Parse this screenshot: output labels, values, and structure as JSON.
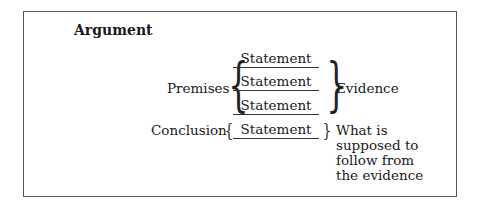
{
  "title": "Argument",
  "premises": {
    "label": "Premises",
    "statements": [
      "Statement",
      "Statement",
      "Statement"
    ],
    "annotation": "Evidence"
  },
  "conclusion": {
    "label": "Conclusion",
    "statement": "Statement",
    "annotation_lines": [
      "What is",
      "supposed to",
      "follow from",
      "the evidence"
    ]
  }
}
